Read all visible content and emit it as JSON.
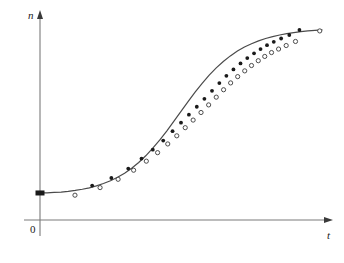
{
  "chart_data": {
    "type": "line",
    "title": "",
    "xlabel": "t",
    "ylabel": "n",
    "origin_label": "0",
    "grid": false,
    "legend": false,
    "axis_style": "arrow-axes",
    "xlim": [
      0,
      1
    ],
    "ylim": [
      0,
      1
    ],
    "curve_color": "#4a4a4a",
    "axis_color": "#7a7a7a",
    "marker_filled_color": "#1a1a1a",
    "marker_open_stroke": "#3a3a3a",
    "marker_open_fill": "#ffffff",
    "origin_marker": {
      "shape": "filled-square",
      "x": 0.0,
      "y": 0.065,
      "color": "#1a1a1a"
    },
    "fitted_curve": {
      "name": "fitted logistic curve",
      "points_x": [
        0.0,
        0.025,
        0.05,
        0.075,
        0.1,
        0.125,
        0.15,
        0.175,
        0.2,
        0.225,
        0.25,
        0.275,
        0.3,
        0.325,
        0.35,
        0.375,
        0.4,
        0.425,
        0.45,
        0.475,
        0.5,
        0.525,
        0.55,
        0.575,
        0.6,
        0.625,
        0.65,
        0.675,
        0.7,
        0.725,
        0.75,
        0.775,
        0.8,
        0.825,
        0.85,
        0.875,
        0.9,
        0.925,
        0.95,
        0.975,
        1.0
      ],
      "points_y": [
        0.065,
        0.066,
        0.068,
        0.07,
        0.074,
        0.079,
        0.085,
        0.093,
        0.103,
        0.116,
        0.131,
        0.15,
        0.172,
        0.199,
        0.23,
        0.266,
        0.307,
        0.352,
        0.401,
        0.453,
        0.506,
        0.559,
        0.61,
        0.658,
        0.702,
        0.741,
        0.776,
        0.806,
        0.832,
        0.854,
        0.872,
        0.887,
        0.9,
        0.91,
        0.919,
        0.926,
        0.932,
        0.937,
        0.941,
        0.944,
        0.947
      ]
    },
    "series": [
      {
        "name": "filled markers",
        "marker": "filled-circle",
        "x": [
          0.185,
          0.253,
          0.313,
          0.36,
          0.4,
          0.437,
          0.47,
          0.5,
          0.528,
          0.556,
          0.583,
          0.61,
          0.636,
          0.661,
          0.686,
          0.711,
          0.735,
          0.759,
          0.782,
          0.805,
          0.829,
          0.855,
          0.884,
          0.92
        ],
        "y": [
          0.105,
          0.146,
          0.197,
          0.251,
          0.299,
          0.348,
          0.399,
          0.445,
          0.488,
          0.531,
          0.574,
          0.617,
          0.659,
          0.698,
          0.733,
          0.765,
          0.794,
          0.82,
          0.843,
          0.864,
          0.882,
          0.9,
          0.919,
          0.946
        ]
      },
      {
        "name": "open markers",
        "marker": "open-circle",
        "x": [
          0.124,
          0.213,
          0.277,
          0.332,
          0.377,
          0.417,
          0.453,
          0.485,
          0.515,
          0.543,
          0.571,
          0.598,
          0.625,
          0.651,
          0.676,
          0.701,
          0.726,
          0.75,
          0.774,
          0.797,
          0.821,
          0.846,
          0.873,
          0.906,
          0.992
        ],
        "y": [
          0.053,
          0.094,
          0.139,
          0.188,
          0.237,
          0.283,
          0.33,
          0.374,
          0.418,
          0.459,
          0.5,
          0.541,
          0.583,
          0.623,
          0.66,
          0.694,
          0.725,
          0.754,
          0.78,
          0.803,
          0.824,
          0.843,
          0.862,
          0.884,
          0.941
        ]
      }
    ]
  },
  "figure": {
    "background": "#ffffff",
    "top_cut_text": ""
  }
}
